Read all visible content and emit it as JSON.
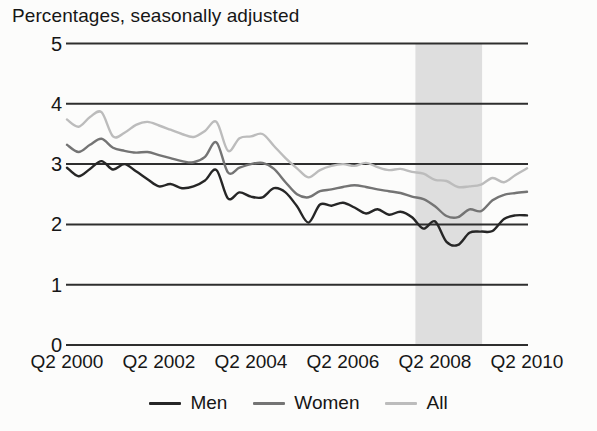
{
  "title": "Percentages, seasonally adjusted",
  "colors": {
    "men": "#262626",
    "women": "#747474",
    "all": "#bcbcbc",
    "gridline": "#2e2e2e",
    "recession_band": "#dedede",
    "text": "#161616",
    "background": "#fcfcfb"
  },
  "y_axis": {
    "labels": [
      "5",
      "4",
      "3",
      "2",
      "1",
      "0"
    ],
    "min": 0,
    "max": 5
  },
  "x_axis": {
    "labels": [
      "Q2 2000",
      "Q2 2002",
      "Q2 2004",
      "Q2 2006",
      "Q2 2008",
      "Q2 2010"
    ]
  },
  "chart_data": {
    "type": "line",
    "title": "Percentages, seasonally adjusted",
    "xlabel": "",
    "ylabel": "Percentages",
    "ylim": [
      0,
      5
    ],
    "grid": "horizontal",
    "legend_position": "bottom-center",
    "x": [
      "2000 Q2",
      "2000 Q3",
      "2000 Q4",
      "2001 Q1",
      "2001 Q2",
      "2001 Q3",
      "2001 Q4",
      "2002 Q1",
      "2002 Q2",
      "2002 Q3",
      "2002 Q4",
      "2003 Q1",
      "2003 Q2",
      "2003 Q3",
      "2003 Q4",
      "2004 Q1",
      "2004 Q2",
      "2004 Q3",
      "2004 Q4",
      "2005 Q1",
      "2005 Q2",
      "2005 Q3",
      "2005 Q4",
      "2006 Q1",
      "2006 Q2",
      "2006 Q3",
      "2006 Q4",
      "2007 Q1",
      "2007 Q2",
      "2007 Q3",
      "2007 Q4",
      "2008 Q1",
      "2008 Q2",
      "2008 Q3",
      "2008 Q4",
      "2009 Q1",
      "2009 Q2",
      "2009 Q3",
      "2009 Q4",
      "2010 Q1",
      "2010 Q2"
    ],
    "series": [
      {
        "name": "Men",
        "color": "#262626",
        "values": [
          2.94,
          2.8,
          2.92,
          3.05,
          2.91,
          3.0,
          2.88,
          2.75,
          2.63,
          2.67,
          2.6,
          2.63,
          2.73,
          2.9,
          2.43,
          2.53,
          2.46,
          2.45,
          2.6,
          2.53,
          2.3,
          2.03,
          2.33,
          2.31,
          2.36,
          2.28,
          2.18,
          2.25,
          2.16,
          2.21,
          2.12,
          1.93,
          2.05,
          1.71,
          1.66,
          1.86,
          1.88,
          1.89,
          2.09,
          2.15,
          2.15
        ]
      },
      {
        "name": "Women",
        "color": "#747474",
        "values": [
          3.32,
          3.2,
          3.32,
          3.42,
          3.27,
          3.22,
          3.19,
          3.2,
          3.15,
          3.1,
          3.05,
          3.03,
          3.12,
          3.36,
          2.86,
          2.94,
          3.0,
          3.02,
          2.92,
          2.7,
          2.5,
          2.45,
          2.55,
          2.58,
          2.62,
          2.65,
          2.62,
          2.58,
          2.55,
          2.52,
          2.46,
          2.42,
          2.3,
          2.14,
          2.12,
          2.25,
          2.22,
          2.4,
          2.49,
          2.52,
          2.54
        ]
      },
      {
        "name": "All",
        "color": "#bcbcbc",
        "values": [
          3.74,
          3.62,
          3.78,
          3.86,
          3.46,
          3.52,
          3.65,
          3.7,
          3.64,
          3.57,
          3.5,
          3.45,
          3.55,
          3.7,
          3.22,
          3.43,
          3.46,
          3.5,
          3.3,
          3.1,
          2.93,
          2.78,
          2.9,
          2.97,
          3.0,
          2.97,
          3.02,
          2.95,
          2.9,
          2.92,
          2.87,
          2.84,
          2.74,
          2.72,
          2.62,
          2.63,
          2.66,
          2.77,
          2.7,
          2.82,
          2.93
        ]
      }
    ],
    "band": {
      "label_from": "2008 Q1",
      "label_to": "2009 Q2",
      "from_quarter_index": 30.3,
      "to_quarter_index": 36.1,
      "meaning": "shaded vertical band (recession period)"
    }
  }
}
